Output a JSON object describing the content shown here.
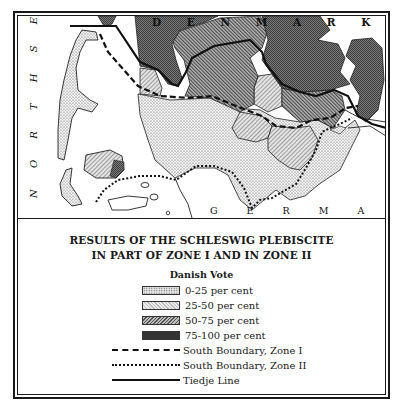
{
  "map": {
    "labels": {
      "north_sea": "N O R T H   S E A",
      "denmark": "D E N M A R K",
      "germany": "G E R M A N Y"
    },
    "colors": {
      "dot": "#e6e6e6",
      "light_hatch": "#d4d4d4",
      "mid_hatch": "#9a9a9a",
      "dark": "#6b6b6b",
      "line": "#111111"
    }
  },
  "legend": {
    "title_line1": "RESULTS OF THE SCHLESWIG PLEBISCITE",
    "title_line2": "IN PART OF ZONE I AND IN ZONE II",
    "subtitle": "Danish Vote",
    "fills": [
      {
        "label": "0-25 per cent",
        "pattern": "dotted"
      },
      {
        "label": "25-50 per cent",
        "pattern": "light-hatch"
      },
      {
        "label": "50-75 per cent",
        "pattern": "dense-hatch"
      },
      {
        "label": "75-100 per cent",
        "pattern": "dark-crosshatch"
      }
    ],
    "lines": [
      {
        "label": "South Boundary, Zone I",
        "style": "dashed"
      },
      {
        "label": "South Boundary, Zone II",
        "style": "dotted"
      },
      {
        "label": "Tiedje Line",
        "style": "solid"
      }
    ]
  }
}
